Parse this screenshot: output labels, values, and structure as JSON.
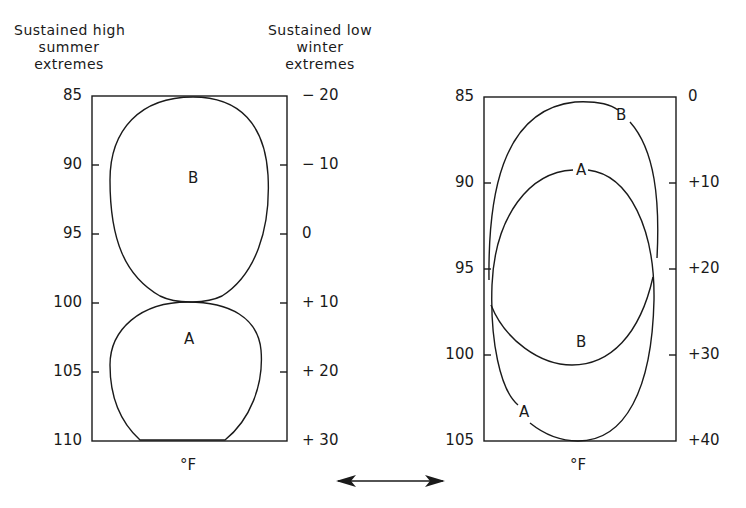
{
  "figure": {
    "left_panel": {
      "header_left": [
        "Sustained high",
        "summer",
        "extremes"
      ],
      "header_right": [
        "Sustained low",
        "winter",
        "extremes"
      ],
      "left_axis_ticks": [
        "85",
        "90",
        "95",
        "100",
        "105",
        "110"
      ],
      "right_axis_ticks": [
        "− 20",
        "− 10",
        "0",
        "+ 10",
        "+ 20",
        "+ 30"
      ],
      "unit_label": "°F",
      "curve_labels": {
        "B": "B",
        "A": "A"
      }
    },
    "right_panel": {
      "left_axis_ticks": [
        "85",
        "90",
        "95",
        "100",
        "105"
      ],
      "right_axis_ticks": [
        "0",
        "+10",
        "+20",
        "+30",
        "+40"
      ],
      "unit_label": "°F",
      "curve_labels": {
        "B_top": "B",
        "A_top": "A",
        "B_bottom": "B",
        "A_bottom": "A"
      }
    },
    "connector": "double-arrow"
  },
  "colors": {
    "ink": "#1a1a1a",
    "background": "#ffffff"
  }
}
